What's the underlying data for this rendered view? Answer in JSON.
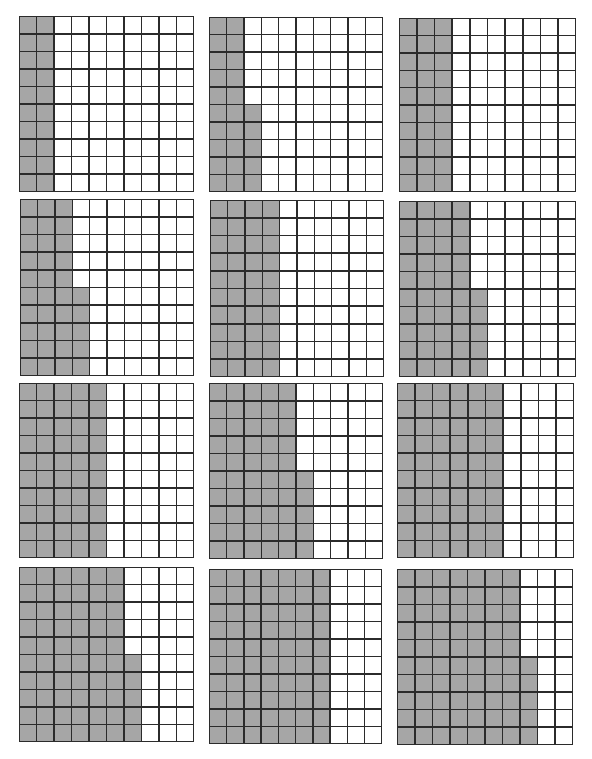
{
  "colors": {
    "shaded": "#a6a6a6",
    "unshaded": "#ffffff",
    "line": "#2b2b2b"
  },
  "grid_size": {
    "rows": 10,
    "cols": 10
  },
  "grids": [
    {
      "id": 1,
      "shaded_cells": 20,
      "full_columns": 2,
      "partial_column_bottom_cells": 0,
      "box": [
        19,
        16,
        175,
        176
      ]
    },
    {
      "id": 2,
      "shaded_cells": 25,
      "full_columns": 2,
      "partial_column_bottom_cells": 5,
      "box": [
        209,
        17,
        174,
        175
      ]
    },
    {
      "id": 3,
      "shaded_cells": 30,
      "full_columns": 3,
      "partial_column_bottom_cells": 0,
      "box": [
        399,
        18,
        177,
        174
      ]
    },
    {
      "id": 4,
      "shaded_cells": 35,
      "full_columns": 3,
      "partial_column_bottom_cells": 5,
      "box": [
        20,
        199,
        174,
        177
      ]
    },
    {
      "id": 5,
      "shaded_cells": 40,
      "full_columns": 4,
      "partial_column_bottom_cells": 0,
      "box": [
        210,
        200,
        174,
        177
      ]
    },
    {
      "id": 6,
      "shaded_cells": 45,
      "full_columns": 4,
      "partial_column_bottom_cells": 5,
      "box": [
        399,
        201,
        177,
        176
      ]
    },
    {
      "id": 7,
      "shaded_cells": 50,
      "full_columns": 5,
      "partial_column_bottom_cells": 0,
      "box": [
        19,
        383,
        175,
        175
      ]
    },
    {
      "id": 8,
      "shaded_cells": 55,
      "full_columns": 5,
      "partial_column_bottom_cells": 5,
      "box": [
        209,
        383,
        174,
        176
      ]
    },
    {
      "id": 9,
      "shaded_cells": 60,
      "full_columns": 6,
      "partial_column_bottom_cells": 0,
      "box": [
        397,
        383,
        177,
        175
      ]
    },
    {
      "id": 10,
      "shaded_cells": 65,
      "full_columns": 6,
      "partial_column_bottom_cells": 5,
      "box": [
        19,
        567,
        175,
        175
      ]
    },
    {
      "id": 11,
      "shaded_cells": 70,
      "full_columns": 7,
      "partial_column_bottom_cells": 0,
      "box": [
        209,
        569,
        173,
        175
      ]
    },
    {
      "id": 12,
      "shaded_cells": 75,
      "full_columns": 7,
      "partial_column_bottom_cells": 5,
      "box": [
        397,
        569,
        176,
        176
      ]
    }
  ]
}
